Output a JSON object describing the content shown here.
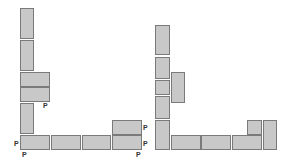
{
  "colors": {
    "block_fill": "#c8c8c8",
    "block_border": "#7a7a7a",
    "label": "#333333"
  },
  "diagrams": [
    {
      "name": "left-packing",
      "blocks": [
        {
          "x": 20,
          "y": 8,
          "w": 14,
          "h": 31
        },
        {
          "x": 20,
          "y": 40,
          "w": 14,
          "h": 31
        },
        {
          "x": 20,
          "y": 72,
          "w": 30,
          "h": 15
        },
        {
          "x": 20,
          "y": 87,
          "w": 30,
          "h": 15
        },
        {
          "x": 20,
          "y": 103,
          "w": 14,
          "h": 31
        },
        {
          "x": 20,
          "y": 135,
          "w": 30,
          "h": 15
        },
        {
          "x": 51,
          "y": 135,
          "w": 30,
          "h": 15
        },
        {
          "x": 82,
          "y": 135,
          "w": 29,
          "h": 15
        },
        {
          "x": 112,
          "y": 135,
          "w": 30,
          "h": 15
        },
        {
          "x": 112,
          "y": 120,
          "w": 30,
          "h": 15
        }
      ],
      "labels": [
        {
          "text": "P",
          "x": 43,
          "y": 102
        },
        {
          "text": "P",
          "x": 14,
          "y": 140
        },
        {
          "text": "P",
          "x": 22,
          "y": 151
        },
        {
          "text": "P",
          "x": 143,
          "y": 124
        },
        {
          "text": "P",
          "x": 143,
          "y": 140
        },
        {
          "text": "P",
          "x": 136,
          "y": 151
        }
      ]
    },
    {
      "name": "right-packing",
      "blocks": [
        {
          "x": 155,
          "y": 25,
          "w": 15,
          "h": 30
        },
        {
          "x": 155,
          "y": 57,
          "w": 15,
          "h": 22
        },
        {
          "x": 155,
          "y": 80,
          "w": 15,
          "h": 15
        },
        {
          "x": 155,
          "y": 96,
          "w": 15,
          "h": 23
        },
        {
          "x": 155,
          "y": 120,
          "w": 15,
          "h": 30
        },
        {
          "x": 171,
          "y": 72,
          "w": 14,
          "h": 31
        },
        {
          "x": 171,
          "y": 135,
          "w": 30,
          "h": 15
        },
        {
          "x": 201,
          "y": 135,
          "w": 30,
          "h": 15
        },
        {
          "x": 232,
          "y": 135,
          "w": 30,
          "h": 15
        },
        {
          "x": 247,
          "y": 120,
          "w": 15,
          "h": 15
        },
        {
          "x": 263,
          "y": 120,
          "w": 14,
          "h": 30
        }
      ],
      "labels": []
    }
  ]
}
